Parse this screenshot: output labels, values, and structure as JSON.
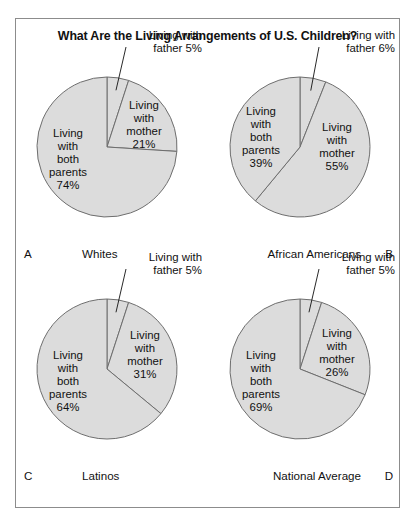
{
  "figure": {
    "title": "What Are the Living Arrangements of U.S. Children?",
    "frame_color": "#8c8c8c",
    "slice_fill": "#dcdcdc",
    "slice_stroke": "#6e6e6e"
  },
  "chart_data": [
    {
      "type": "pie",
      "panel": "A",
      "title": "Whites",
      "categories": [
        "Living with both parents",
        "Living with mother",
        "Living with father"
      ],
      "values": [
        74,
        21,
        5
      ],
      "labels": [
        {
          "line1": "Living",
          "line2": "with",
          "line3": "both",
          "line4": "parents",
          "line5": "74%"
        },
        {
          "line1": "Living",
          "line2": "with",
          "line3": "mother",
          "line4": "21%"
        },
        {
          "line1": "Living with",
          "line2": "father 5%"
        }
      ]
    },
    {
      "type": "pie",
      "panel": "B",
      "title": "African Americans",
      "categories": [
        "Living with both parents",
        "Living with mother",
        "Living with father"
      ],
      "values": [
        39,
        55,
        6
      ],
      "labels": [
        {
          "line1": "Living",
          "line2": "with",
          "line3": "both",
          "line4": "parents",
          "line5": "39%"
        },
        {
          "line1": "Living",
          "line2": "with",
          "line3": "mother",
          "line4": "55%"
        },
        {
          "line1": "Living with",
          "line2": "father 6%"
        }
      ]
    },
    {
      "type": "pie",
      "panel": "C",
      "title": "Latinos",
      "categories": [
        "Living with both parents",
        "Living with mother",
        "Living with father"
      ],
      "values": [
        64,
        31,
        5
      ],
      "labels": [
        {
          "line1": "Living",
          "line2": "with",
          "line3": "both",
          "line4": "parents",
          "line5": "64%"
        },
        {
          "line1": "Living",
          "line2": "with",
          "line3": "mother",
          "line4": "31%"
        },
        {
          "line1": "Living with",
          "line2": "father 5%"
        }
      ]
    },
    {
      "type": "pie",
      "panel": "D",
      "title": "National Average",
      "categories": [
        "Living with both parents",
        "Living with mother",
        "Living with father"
      ],
      "values": [
        69,
        26,
        5
      ],
      "labels": [
        {
          "line1": "Living",
          "line2": "with",
          "line3": "both",
          "line4": "parents",
          "line5": "69%"
        },
        {
          "line1": "Living",
          "line2": "with",
          "line3": "mother",
          "line4": "26%"
        },
        {
          "line1": "Living with",
          "line2": "father 5%"
        }
      ]
    }
  ]
}
